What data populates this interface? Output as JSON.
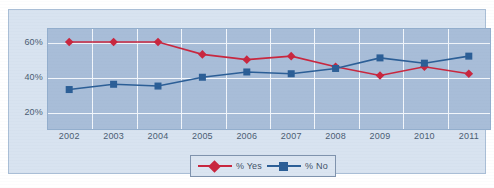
{
  "chart_data": {
    "type": "line",
    "title": "",
    "subtitle": "",
    "xlabel": "",
    "ylabel": "",
    "categories": [
      "2002",
      "2003",
      "2004",
      "2005",
      "2006",
      "2007",
      "2008",
      "2009",
      "2010",
      "2011"
    ],
    "series": [
      {
        "name": "% Yes",
        "color": "#c9263e",
        "marker": "diamond",
        "values": [
          60,
          60,
          60,
          53,
          50,
          52,
          46,
          41,
          46,
          42
        ]
      },
      {
        "name": "% No",
        "color": "#2b5e96",
        "marker": "square",
        "values": [
          33,
          36,
          35,
          40,
          43,
          42,
          45,
          51,
          48,
          52
        ]
      }
    ],
    "ylim": [
      10,
      68
    ],
    "yticks": [
      20,
      40,
      60
    ],
    "ytick_labels": [
      "20%",
      "40%",
      "60%"
    ],
    "grid": true,
    "legend_position": "bottom-center"
  },
  "legend": {
    "entries": [
      {
        "label": "% Yes"
      },
      {
        "label": "% No"
      }
    ]
  },
  "colors": {
    "yes_series": "#c9263e",
    "no_series": "#2b5e96",
    "plot_background": "#a8bdd8",
    "panel_background": "#d8e3f0",
    "gridline": "#f2f6fb",
    "axis_text": "#4a5c72"
  }
}
